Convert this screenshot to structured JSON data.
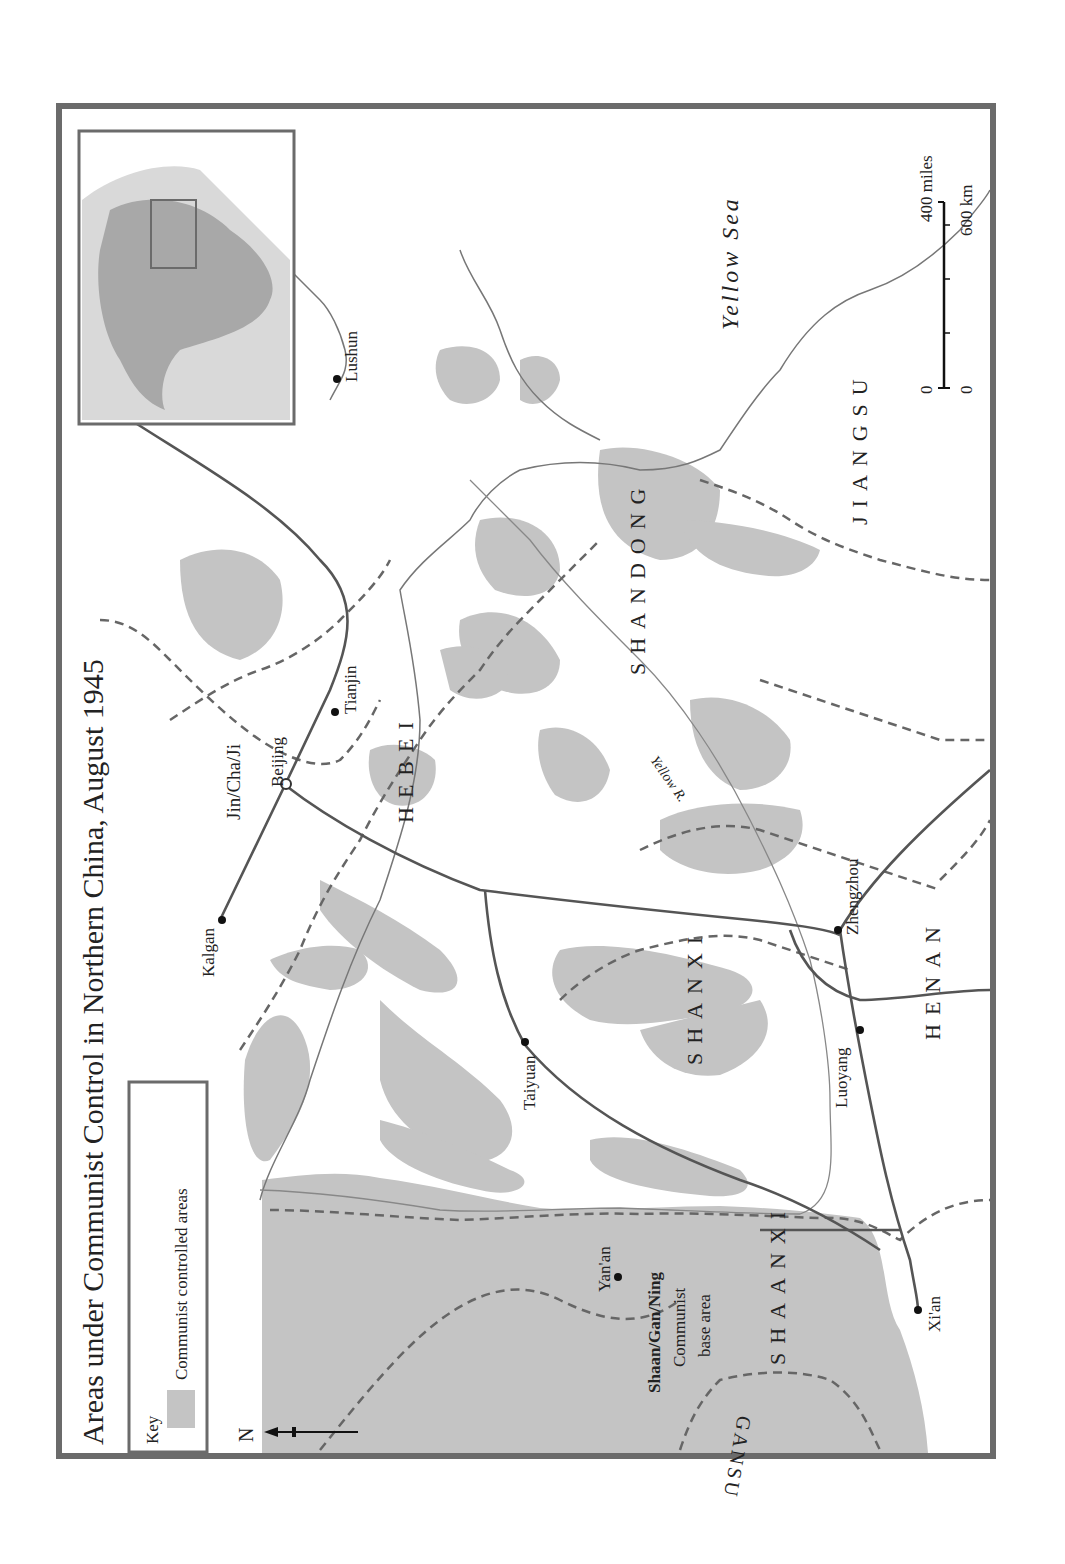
{
  "title": "Areas under Communist Control in Northern China, August 1945",
  "key": {
    "heading": "Key",
    "items": [
      {
        "label": "Communist controlled areas",
        "color": "#c4c4c4"
      }
    ]
  },
  "north_arrow": {
    "label": "N"
  },
  "scale_bar": {
    "miles_start": "0",
    "miles_end": "400 miles",
    "km_start": "0",
    "km_end": "600 km"
  },
  "seas": [
    {
      "name": "Yellow Sea"
    }
  ],
  "rivers": [
    {
      "name": "Yellow R."
    }
  ],
  "provinces": [
    {
      "name": "HEBEI"
    },
    {
      "name": "SHANDONG"
    },
    {
      "name": "JIANGSU"
    },
    {
      "name": "SHANXI"
    },
    {
      "name": "HENAN"
    },
    {
      "name": "SHAANXI"
    },
    {
      "name": "GANSU"
    }
  ],
  "base_areas": [
    {
      "name": "Jin/Cha/Ji"
    },
    {
      "name_line1": "Shaan/Gan/Ning",
      "name_line2": "Communist",
      "name_line3": "base area"
    }
  ],
  "cities": [
    {
      "name": "Beijing"
    },
    {
      "name": "Tianjin"
    },
    {
      "name": "Kalgan"
    },
    {
      "name": "Taiyuan"
    },
    {
      "name": "Zhengzhou"
    },
    {
      "name": "Luoyang"
    },
    {
      "name": "Xi'an"
    },
    {
      "name": "Yan'an"
    },
    {
      "name": "Lushun"
    }
  ],
  "colors": {
    "frame": "#6b6b6b",
    "communist_area": "#c4c4c4",
    "inset_dark": "#a8a8a8",
    "inset_light": "#d9d9d9",
    "railway": "#555555",
    "border_dash": "#666666",
    "coast": "#777777"
  }
}
